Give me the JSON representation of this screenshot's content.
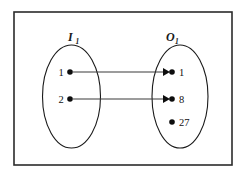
{
  "diagram": {
    "type": "set-mapping-diagram",
    "frame": {
      "x": 14,
      "y": 12,
      "width": 218,
      "height": 153
    },
    "sets": [
      {
        "id": "domain",
        "name": "domain-set",
        "label_main": "I",
        "label_sub": "1",
        "label_x": 68,
        "label_y": 41,
        "ellipse": {
          "cx": 71.5,
          "cy": 96.5,
          "rx": 29,
          "ry": 51.5
        },
        "elements": [
          {
            "label": "1",
            "dot_x": 70,
            "dot_y": 72,
            "label_x": 61,
            "label_y": 76
          },
          {
            "label": "2",
            "dot_x": 70,
            "dot_y": 99,
            "label_x": 61,
            "label_y": 103
          }
        ]
      },
      {
        "id": "codomain",
        "name": "codomain-set",
        "label_main": "O",
        "label_sub": "1",
        "label_x": 166,
        "label_y": 41,
        "ellipse": {
          "cx": 180,
          "cy": 96.5,
          "rx": 28,
          "ry": 51.5
        },
        "elements": [
          {
            "label": "1",
            "dot_x": 172,
            "dot_y": 72,
            "label_x": 179,
            "label_y": 76
          },
          {
            "label": "8",
            "dot_x": 172,
            "dot_y": 99,
            "label_x": 179,
            "label_y": 103
          },
          {
            "label": "27",
            "dot_x": 172,
            "dot_y": 122,
            "label_x": 179,
            "label_y": 126
          }
        ]
      }
    ],
    "arrows": [
      {
        "id": "arrow-1-to-1",
        "from_label": "1",
        "to_label": "1",
        "x1": 73,
        "y1": 72,
        "x2": 170,
        "y2": 72
      },
      {
        "id": "arrow-2-to-8",
        "from_label": "2",
        "to_label": "8",
        "x1": 73,
        "y1": 99,
        "x2": 170,
        "y2": 99
      }
    ],
    "mappings": [
      {
        "input": "1",
        "output": "1"
      },
      {
        "input": "2",
        "output": "8"
      }
    ],
    "unmapped_outputs": [
      "27"
    ],
    "colors": {
      "stroke": "#1a1a1a",
      "frame": "#2b2b2b",
      "arrow": "#3a3a3a",
      "dot": "#0d0d0d",
      "background": "#ffffff"
    }
  }
}
